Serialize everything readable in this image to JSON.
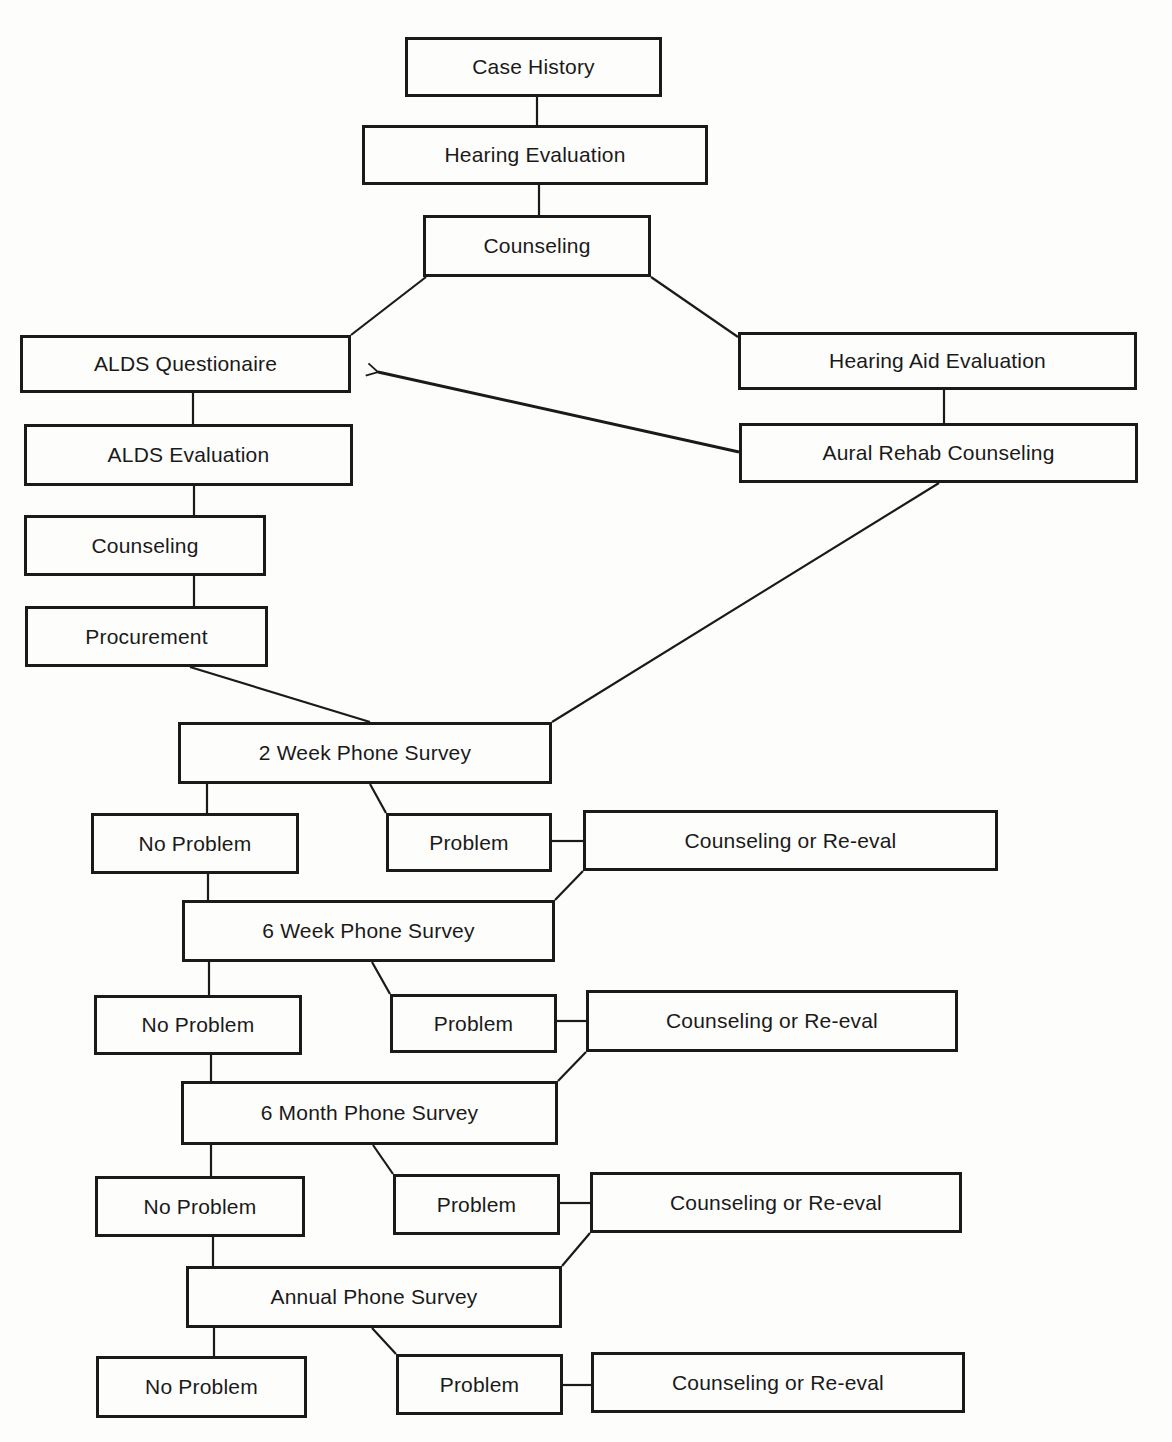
{
  "diagram": {
    "type": "flowchart",
    "nodes": [
      {
        "id": "case_history",
        "label": "Case History",
        "x": 405,
        "y": 37,
        "w": 257,
        "h": 60
      },
      {
        "id": "hearing_evaluation",
        "label": "Hearing Evaluation",
        "x": 362,
        "y": 125,
        "w": 346,
        "h": 60
      },
      {
        "id": "counseling_top",
        "label": "Counseling",
        "x": 423,
        "y": 215,
        "w": 228,
        "h": 62
      },
      {
        "id": "alds_questionaire",
        "label": "ALDS Questionaire",
        "x": 20,
        "y": 335,
        "w": 331,
        "h": 58
      },
      {
        "id": "hearing_aid_evaluation",
        "label": "Hearing Aid Evaluation",
        "x": 738,
        "y": 332,
        "w": 399,
        "h": 58
      },
      {
        "id": "alds_evaluation",
        "label": "ALDS Evaluation",
        "x": 24,
        "y": 424,
        "w": 329,
        "h": 62
      },
      {
        "id": "aural_rehab_counseling",
        "label": "Aural Rehab Counseling",
        "x": 739,
        "y": 423,
        "w": 399,
        "h": 60
      },
      {
        "id": "counseling_left",
        "label": "Counseling",
        "x": 24,
        "y": 515,
        "w": 242,
        "h": 61
      },
      {
        "id": "procurement",
        "label": "Procurement",
        "x": 25,
        "y": 606,
        "w": 243,
        "h": 61
      },
      {
        "id": "survey_2week",
        "label": "2 Week Phone Survey",
        "x": 178,
        "y": 722,
        "w": 374,
        "h": 62
      },
      {
        "id": "no_problem_1",
        "label": "No Problem",
        "x": 91,
        "y": 813,
        "w": 208,
        "h": 61
      },
      {
        "id": "problem_1",
        "label": "Problem",
        "x": 386,
        "y": 813,
        "w": 166,
        "h": 59
      },
      {
        "id": "counseling_reeval_1",
        "label": "Counseling or Re-eval",
        "x": 583,
        "y": 810,
        "w": 415,
        "h": 61
      },
      {
        "id": "survey_6week",
        "label": "6 Week Phone Survey",
        "x": 182,
        "y": 900,
        "w": 373,
        "h": 62
      },
      {
        "id": "no_problem_2",
        "label": "No Problem",
        "x": 94,
        "y": 995,
        "w": 208,
        "h": 60
      },
      {
        "id": "problem_2",
        "label": "Problem",
        "x": 390,
        "y": 994,
        "w": 167,
        "h": 59
      },
      {
        "id": "counseling_reeval_2",
        "label": "Counseling or Re-eval",
        "x": 586,
        "y": 990,
        "w": 372,
        "h": 62
      },
      {
        "id": "survey_6month",
        "label": "6 Month Phone Survey",
        "x": 181,
        "y": 1081,
        "w": 377,
        "h": 64
      },
      {
        "id": "no_problem_3",
        "label": "No Problem",
        "x": 95,
        "y": 1176,
        "w": 210,
        "h": 61
      },
      {
        "id": "problem_3",
        "label": "Problem",
        "x": 393,
        "y": 1174,
        "w": 167,
        "h": 61
      },
      {
        "id": "counseling_reeval_3",
        "label": "Counseling or Re-eval",
        "x": 590,
        "y": 1172,
        "w": 372,
        "h": 61
      },
      {
        "id": "survey_annual",
        "label": "Annual Phone Survey",
        "x": 186,
        "y": 1266,
        "w": 376,
        "h": 62
      },
      {
        "id": "no_problem_4",
        "label": "No Problem",
        "x": 96,
        "y": 1356,
        "w": 211,
        "h": 62
      },
      {
        "id": "problem_4",
        "label": "Problem",
        "x": 396,
        "y": 1354,
        "w": 167,
        "h": 61
      },
      {
        "id": "counseling_reeval_4",
        "label": "Counseling or Re-eval",
        "x": 591,
        "y": 1352,
        "w": 374,
        "h": 61
      }
    ],
    "edges": [
      {
        "from": "case_history",
        "to": "hearing_evaluation",
        "points": [
          [
            537,
            97
          ],
          [
            537,
            125
          ]
        ]
      },
      {
        "from": "hearing_evaluation",
        "to": "counseling_top",
        "points": [
          [
            539,
            185
          ],
          [
            539,
            215
          ]
        ]
      },
      {
        "from": "counseling_top",
        "to": "alds_questionaire",
        "points": [
          [
            426,
            277
          ],
          [
            351,
            335
          ]
        ]
      },
      {
        "from": "counseling_top",
        "to": "hearing_aid_evaluation",
        "points": [
          [
            651,
            277
          ],
          [
            738,
            337
          ]
        ]
      },
      {
        "from": "alds_questionaire",
        "to": "alds_evaluation",
        "points": [
          [
            193,
            393
          ],
          [
            193,
            424
          ]
        ]
      },
      {
        "from": "hearing_aid_evaluation",
        "to": "aural_rehab_counseling",
        "points": [
          [
            944,
            390
          ],
          [
            944,
            423
          ]
        ]
      },
      {
        "from": "aural_rehab_counseling",
        "to": "alds_questionaire",
        "points": [
          [
            739,
            452
          ],
          [
            378,
            372
          ]
        ],
        "arrow": true
      },
      {
        "from": "alds_evaluation",
        "to": "counseling_left",
        "points": [
          [
            194,
            486
          ],
          [
            194,
            515
          ]
        ]
      },
      {
        "from": "counseling_left",
        "to": "procurement",
        "points": [
          [
            194,
            576
          ],
          [
            194,
            606
          ]
        ]
      },
      {
        "from": "procurement",
        "to": "survey_2week",
        "points": [
          [
            190,
            667
          ],
          [
            370,
            722
          ]
        ]
      },
      {
        "from": "aural_rehab_counseling",
        "to": "survey_2week",
        "points": [
          [
            939,
            483
          ],
          [
            552,
            722
          ]
        ]
      },
      {
        "from": "survey_2week",
        "to": "no_problem_1",
        "points": [
          [
            207,
            784
          ],
          [
            207,
            813
          ]
        ]
      },
      {
        "from": "survey_2week",
        "to": "problem_1",
        "points": [
          [
            370,
            784
          ],
          [
            386,
            813
          ]
        ]
      },
      {
        "from": "problem_1",
        "to": "counseling_reeval_1",
        "points": [
          [
            552,
            841
          ],
          [
            583,
            841
          ]
        ]
      },
      {
        "from": "no_problem_1",
        "to": "survey_6week",
        "points": [
          [
            208,
            874
          ],
          [
            208,
            900
          ]
        ]
      },
      {
        "from": "counseling_reeval_1",
        "to": "survey_6week",
        "points": [
          [
            583,
            871
          ],
          [
            555,
            900
          ]
        ]
      },
      {
        "from": "survey_6week",
        "to": "no_problem_2",
        "points": [
          [
            209,
            962
          ],
          [
            209,
            995
          ]
        ]
      },
      {
        "from": "survey_6week",
        "to": "problem_2",
        "points": [
          [
            372,
            962
          ],
          [
            390,
            994
          ]
        ]
      },
      {
        "from": "problem_2",
        "to": "counseling_reeval_2",
        "points": [
          [
            557,
            1021
          ],
          [
            586,
            1021
          ]
        ]
      },
      {
        "from": "no_problem_2",
        "to": "survey_6month",
        "points": [
          [
            211,
            1055
          ],
          [
            211,
            1081
          ]
        ]
      },
      {
        "from": "counseling_reeval_2",
        "to": "survey_6month",
        "points": [
          [
            586,
            1052
          ],
          [
            558,
            1081
          ]
        ]
      },
      {
        "from": "survey_6month",
        "to": "no_problem_3",
        "points": [
          [
            211,
            1145
          ],
          [
            211,
            1176
          ]
        ]
      },
      {
        "from": "survey_6month",
        "to": "problem_3",
        "points": [
          [
            373,
            1145
          ],
          [
            393,
            1174
          ]
        ]
      },
      {
        "from": "problem_3",
        "to": "counseling_reeval_3",
        "points": [
          [
            560,
            1203
          ],
          [
            590,
            1203
          ]
        ]
      },
      {
        "from": "no_problem_3",
        "to": "survey_annual",
        "points": [
          [
            213,
            1237
          ],
          [
            213,
            1266
          ]
        ]
      },
      {
        "from": "counseling_reeval_3",
        "to": "survey_annual",
        "points": [
          [
            590,
            1233
          ],
          [
            562,
            1266
          ]
        ]
      },
      {
        "from": "survey_annual",
        "to": "no_problem_4",
        "points": [
          [
            214,
            1328
          ],
          [
            214,
            1356
          ]
        ]
      },
      {
        "from": "survey_annual",
        "to": "problem_4",
        "points": [
          [
            372,
            1328
          ],
          [
            396,
            1354
          ]
        ]
      },
      {
        "from": "problem_4",
        "to": "counseling_reeval_4",
        "points": [
          [
            563,
            1385
          ],
          [
            591,
            1385
          ]
        ]
      }
    ]
  },
  "colors": {
    "ink": "#1a1a1a",
    "paper": "#fdfdfc"
  }
}
